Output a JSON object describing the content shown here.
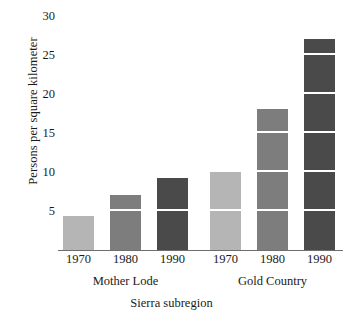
{
  "chart_data": {
    "type": "bar",
    "title": "",
    "subtitle": "",
    "xlabel": "Sierra subregion",
    "ylabel": "Persons per square kilometer",
    "grid": false,
    "legend": "none",
    "ylim": [
      0,
      31
    ],
    "yticks": [
      5,
      10,
      15,
      20,
      25,
      30
    ],
    "ytick_labels": [
      "5",
      "10",
      "15",
      "20",
      "25",
      "30"
    ],
    "segment_interval": 5,
    "groups": [
      {
        "name": "Mother Lode",
        "categories": [
          "1970",
          "1980",
          "1990"
        ],
        "values": [
          4.3,
          7.0,
          9.2
        ]
      },
      {
        "name": "Gold Country",
        "categories": [
          "1970",
          "1980",
          "1990"
        ],
        "values": [
          10.0,
          18.0,
          27.0
        ]
      }
    ],
    "categories": [
      "1970",
      "1980",
      "1990"
    ],
    "series": [
      {
        "name": "Mother Lode",
        "values": [
          4.3,
          7.0,
          9.2
        ]
      },
      {
        "name": "Gold Country",
        "values": [
          10.0,
          18.0,
          27.0
        ]
      }
    ],
    "colors": {
      "year_1970": "#b5b5b5",
      "year_1980": "#7d7d7d",
      "year_1990": "#4a4a4a",
      "axis": "#6e6e6e",
      "segment_divider": "#ffffff",
      "background": "#ffffff",
      "text": "#1a1a1a"
    }
  },
  "axes": {
    "y_title": "Persons per square kilometer",
    "x_title": "Sierra subregion",
    "y_ticks": [
      "5",
      "10",
      "15",
      "20",
      "25",
      "30"
    ],
    "x_ticks": [
      "1970",
      "1980",
      "1990",
      "1970",
      "1980",
      "1990"
    ],
    "group_labels": [
      "Mother Lode",
      "Gold Country"
    ]
  }
}
